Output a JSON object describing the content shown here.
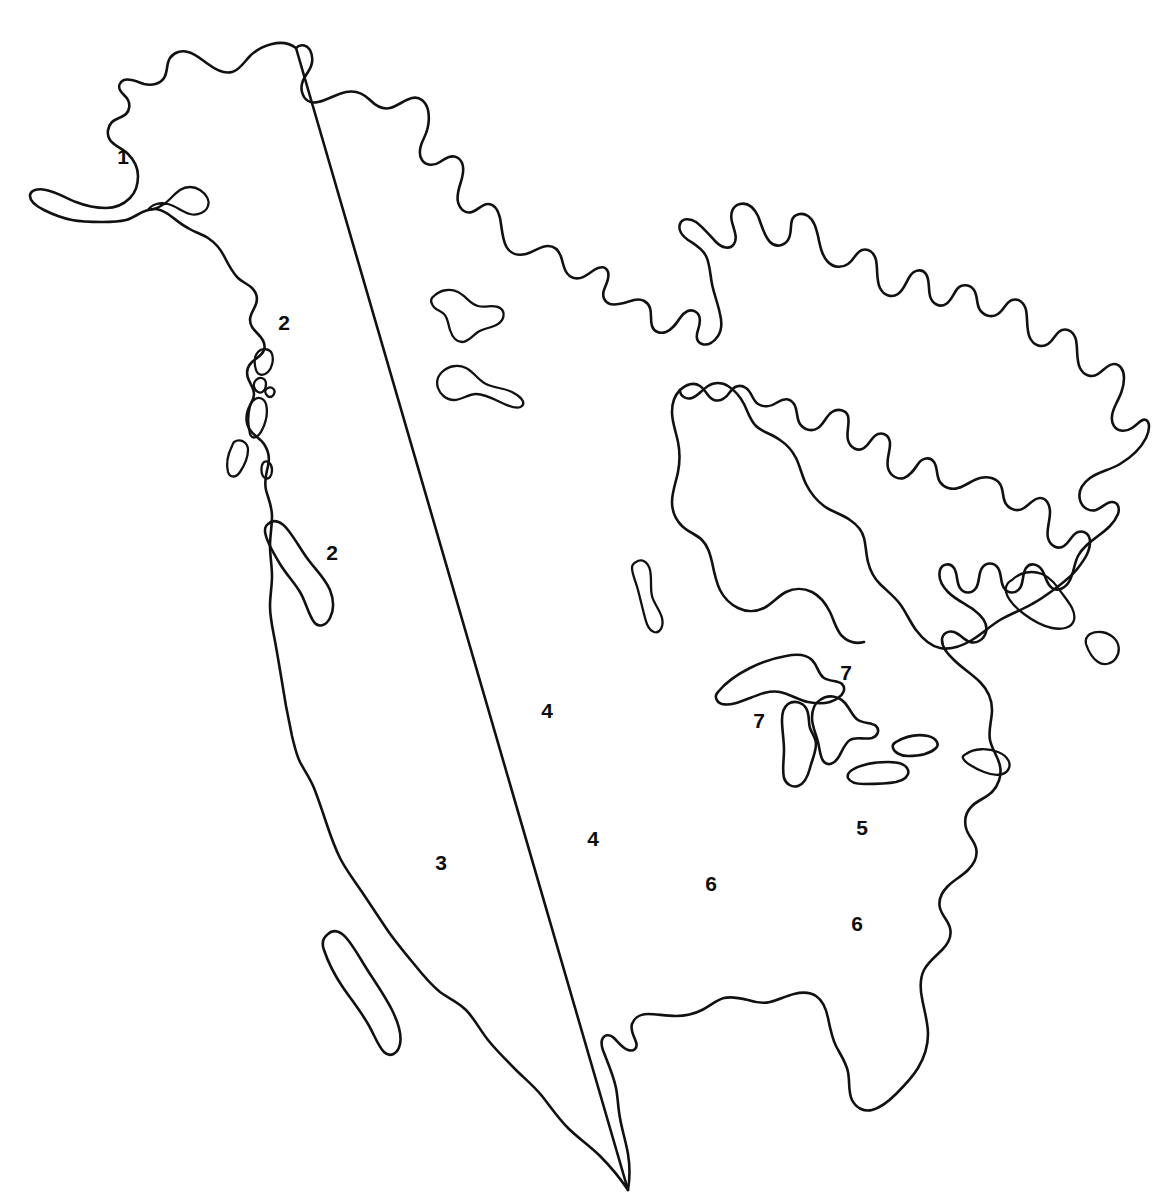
{
  "figure": {
    "kind": "outline-map",
    "background_color": "#ffffff",
    "line_color": "#111111",
    "label_color": "#0d0d0d",
    "width": 1158,
    "height": 1203
  },
  "region_labels": [
    {
      "id": "label-1",
      "text": "1",
      "x": 123,
      "y": 156
    },
    {
      "id": "label-2-a",
      "text": "2",
      "x": 284,
      "y": 322
    },
    {
      "id": "label-2-b",
      "text": "2",
      "x": 332,
      "y": 552
    },
    {
      "id": "label-3",
      "text": "3",
      "x": 441,
      "y": 862
    },
    {
      "id": "label-4-a",
      "text": "4",
      "x": 547,
      "y": 710
    },
    {
      "id": "label-4-b",
      "text": "4",
      "x": 593,
      "y": 838
    },
    {
      "id": "label-5",
      "text": "5",
      "x": 862,
      "y": 827
    },
    {
      "id": "label-6-a",
      "text": "6",
      "x": 711,
      "y": 883
    },
    {
      "id": "label-6-b",
      "text": "6",
      "x": 857,
      "y": 923
    },
    {
      "id": "label-7-a",
      "text": "7",
      "x": 846,
      "y": 672
    },
    {
      "id": "label-7-b",
      "text": "7",
      "x": 759,
      "y": 720
    }
  ],
  "features": {
    "mainland": "continental-north-america-outline",
    "islands": [
      "arctic-island-upper",
      "arctic-island-lower",
      "vancouver-island",
      "queen-charlotte-islands",
      "coastal-islets",
      "baja-california-peninsula",
      "interior-lake-winnipeg",
      "lake-superior",
      "lake-michigan",
      "lake-huron",
      "lake-erie",
      "lake-ontario",
      "newfoundland",
      "nova-scotia",
      "long-island"
    ]
  }
}
